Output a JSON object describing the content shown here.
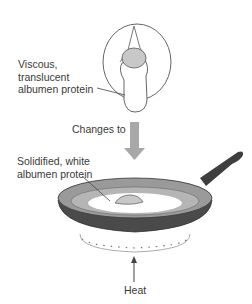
{
  "diagram": {
    "top_caption_partial": "",
    "labels": {
      "raw_egg": [
        "Viscous,",
        "translucent",
        "albumen protein"
      ],
      "transition": "Changes to",
      "cooked_egg": [
        "Solidified, white",
        "albumen protein"
      ],
      "heat": "Heat"
    },
    "colors": {
      "pan_body": "#4a4a4a",
      "pan_rim": "#9a9a9a",
      "pan_handle": "#3e3e3e",
      "yolk": "#c8c8c8",
      "arrow": "#a8a8a8",
      "outline": "#555555"
    }
  }
}
